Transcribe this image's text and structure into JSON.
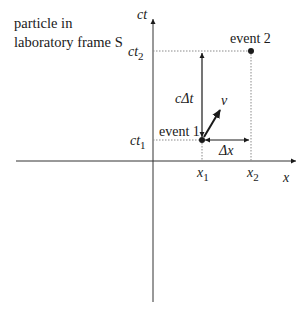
{
  "diagram": {
    "caption_line1": "particle in",
    "caption_line2": "laboratory frame S",
    "axes": {
      "vertical_label_c": "c",
      "vertical_label_t": "t",
      "horizontal_label": "x"
    },
    "ticks": {
      "ct2": {
        "main": "ct",
        "sub": "2"
      },
      "ct1": {
        "main": "ct",
        "sub": "1"
      },
      "x1": {
        "main": "x",
        "sub": "1"
      },
      "x2": {
        "main": "x",
        "sub": "2"
      }
    },
    "events": {
      "event1": "event 1",
      "event2": "event 2"
    },
    "intervals": {
      "time": "cΔt",
      "space": "Δx"
    },
    "velocity_label": "v",
    "colors": {
      "ink": "#1a1a1a",
      "axis": "#333333",
      "dotted": "#8a8a8a"
    }
  }
}
